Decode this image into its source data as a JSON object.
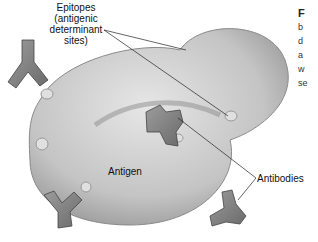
{
  "figure": {
    "labels": {
      "epitopes_line1": "Epitopes",
      "epitopes_line2": "(antigenic",
      "epitopes_line3": "determinant",
      "epitopes_line4": "sites)",
      "antigen": "Antigen",
      "antibodies": "Antibodies"
    },
    "caption_fragment": [
      "F",
      "b",
      "d",
      "a",
      "w",
      "se"
    ]
  }
}
